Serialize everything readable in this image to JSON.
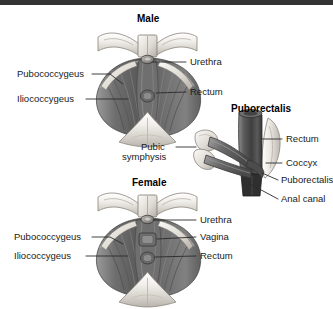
{
  "figure": {
    "kind": "anatomical-illustration",
    "background_color": "#ffffff",
    "top_bar_color": "#343434",
    "ink_color": "#1a1a1a"
  },
  "panels": {
    "male": {
      "title": "Male",
      "labels": {
        "pubococcygeus": "Pubococcygeus",
        "iliococcygeus": "Iliococcygeus",
        "urethra": "Urethra",
        "rectum": "Rectum",
        "pubic": "Pubic",
        "symphysis": "symphysis"
      }
    },
    "female": {
      "title": "Female",
      "labels": {
        "pubococcygeus": "Pubococcygeus",
        "iliococcygeus": "Iliococcygeus",
        "urethra": "Urethra",
        "vagina": "Vagina",
        "rectum": "Rectum"
      }
    },
    "puborectalis": {
      "title": "Puborectalis",
      "labels": {
        "rectum": "Rectum",
        "coccyx": "Coccyx",
        "puborectalis": "Puborectalis",
        "anal_canal": "Anal canal"
      }
    }
  }
}
